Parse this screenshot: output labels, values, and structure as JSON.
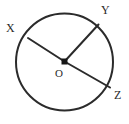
{
  "figure": {
    "type": "circle-geometry-diagram",
    "background_color": "#ffffff",
    "stroke_color": "#2b2b2b",
    "label_color": "#2b2b2b",
    "circle": {
      "center_x": 64.5,
      "center_y": 62,
      "radius": 48.5,
      "stroke_width": 2
    },
    "center_point": {
      "x": 64.5,
      "y": 61.5,
      "size": 6,
      "shape": "filled-square"
    },
    "segments": [
      {
        "name": "segment-ox",
        "x1": 64.5,
        "y1": 61.5,
        "x2": 28.0,
        "y2": 38.0,
        "stroke_width": 2
      },
      {
        "name": "segment-oy",
        "x1": 64.5,
        "y1": 61.5,
        "x2": 98.5,
        "y2": 24.5,
        "stroke_width": 2
      },
      {
        "name": "segment-oz",
        "x1": 64.5,
        "y1": 61.5,
        "x2": 110.0,
        "y2": 87.5,
        "stroke_width": 2
      }
    ],
    "labels": {
      "x": "X",
      "y": "Y",
      "z": "Z",
      "o": "O"
    }
  }
}
